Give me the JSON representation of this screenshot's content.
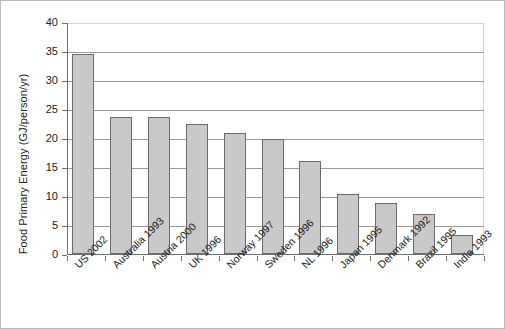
{
  "figure": {
    "background_color": "#ffffff",
    "border_color": "#b9b9b9",
    "bar_fill_color": "#c9c9c9",
    "bar_edge_color": "#6b6b6b",
    "gridline_color": "#9a9a9a",
    "axis_color": "#6f6f6f",
    "text_color": "#222222"
  },
  "chart_data": {
    "type": "bar",
    "title": "",
    "xlabel": "",
    "ylabel": "Food Primary Energy (GJ/person/yr)",
    "ylim": [
      0,
      40
    ],
    "ytick_step": 5,
    "yticks": [
      "0",
      "5",
      "10",
      "15",
      "20",
      "25",
      "30",
      "35",
      "40"
    ],
    "grid": "horizontal",
    "legend": "none",
    "categories": [
      "US 2002",
      "Australia 1993",
      "Austria 2000",
      "UK 1996",
      "Norway 1997",
      "Sweden 1996",
      "NL 1996",
      "Japan 1995",
      "Denmark 1992",
      "Brazil 1995",
      "India 1993"
    ],
    "values": [
      34.5,
      23.7,
      23.7,
      22.4,
      20.8,
      19.8,
      16.0,
      10.4,
      8.8,
      6.9,
      3.3
    ]
  }
}
